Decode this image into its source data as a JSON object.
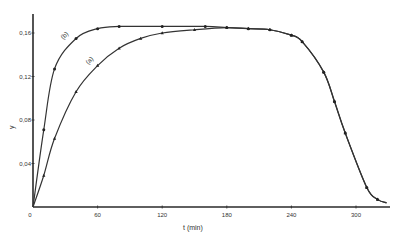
{
  "chart_data": {
    "type": "line",
    "title": "",
    "xlabel": "t  (min)",
    "ylabel": "y",
    "xlim": [
      0,
      330
    ],
    "ylim": [
      0,
      0.18
    ],
    "grid": false,
    "legend": "inline curve labels",
    "x_ticks": [
      0,
      60,
      120,
      180,
      240,
      300
    ],
    "x_tick_labels": [
      "0",
      "60",
      "120",
      "180",
      "240",
      "300"
    ],
    "y_ticks": [
      0.04,
      0.08,
      0.12,
      0.16
    ],
    "y_tick_labels": [
      "0,04",
      "0,08",
      "0,12",
      "0,16"
    ],
    "series": [
      {
        "name": "(a)",
        "marker": "triangle",
        "x": [
          0,
          10,
          20,
          40,
          60,
          80,
          100,
          120,
          150,
          180,
          200,
          220,
          240,
          250,
          270,
          280,
          290,
          310,
          320
        ],
        "values": [
          0,
          0.029,
          0.063,
          0.106,
          0.13,
          0.146,
          0.155,
          0.16,
          0.163,
          0.165,
          0.164,
          0.163,
          0.158,
          0.152,
          0.124,
          0.097,
          0.068,
          0.018,
          0.007
        ],
        "label_pos": {
          "x": 91,
          "y": 62
        }
      },
      {
        "name": "(b)",
        "marker": "circle",
        "x": [
          0,
          10,
          20,
          40,
          60,
          80,
          120,
          160,
          180,
          200,
          220,
          240,
          250,
          270,
          280,
          290,
          310,
          320
        ],
        "values": [
          0,
          0.071,
          0.127,
          0.155,
          0.164,
          0.166,
          0.166,
          0.166,
          0.165,
          0.164,
          0.163,
          0.158,
          0.152,
          0.124,
          0.097,
          0.068,
          0.018,
          0.007
        ],
        "label_pos": {
          "x": 66,
          "y": 37
        }
      }
    ],
    "plot_box": {
      "x0": 33,
      "y0": 207,
      "x_scale": 1.0767,
      "y_scale": 1087.5,
      "x_end": 390,
      "y_top": 14
    }
  }
}
